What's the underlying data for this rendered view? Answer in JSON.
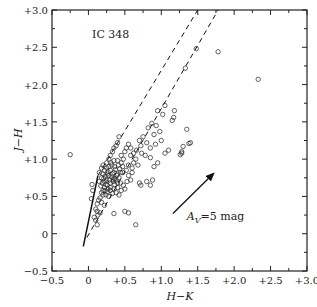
{
  "chart_data": {
    "type": "scatter",
    "title": "IC 348",
    "xlabel": "H−K",
    "ylabel": "J−H",
    "xlim": [
      -0.5,
      3.0
    ],
    "ylim": [
      -0.5,
      3.0
    ],
    "grid": false,
    "legend": null,
    "x_ticks": [
      "-0.5",
      "0",
      "+0.5",
      "+1.0",
      "+1.5",
      "+2.0",
      "+2.5",
      "+3.0"
    ],
    "y_ticks": [
      "-0.5",
      "0",
      "+0.5",
      "+1.0",
      "+1.5",
      "+2.0",
      "+2.5",
      "+3.0"
    ],
    "annotations": [
      {
        "text": "IC 348",
        "x": 0.05,
        "y": 2.62
      },
      {
        "text": "A_V=5 mag",
        "x": 1.35,
        "y": 0.18,
        "arrow_from": [
          1.16,
          0.27
        ],
        "arrow_to": [
          1.72,
          0.81
        ]
      }
    ],
    "lines": [
      {
        "name": "main-sequence-solid",
        "style": "solid",
        "points": [
          [
            -0.07,
            -0.17
          ],
          [
            0.13,
            0.78
          ]
        ]
      },
      {
        "name": "reddening-band-upper",
        "style": "dashed",
        "points": [
          [
            0.13,
            0.78
          ],
          [
            1.5,
            3.0
          ]
        ]
      },
      {
        "name": "reddening-band-lower",
        "style": "dashed",
        "points": [
          [
            -0.02,
            -0.05
          ],
          [
            1.78,
            3.0
          ]
        ]
      }
    ],
    "series": [
      {
        "name": "IC 348 stars",
        "marker": "open-circle",
        "points": [
          [
            -0.25,
            1.06
          ],
          [
            1.78,
            2.44
          ],
          [
            2.33,
            2.07
          ],
          [
            1.48,
            2.48
          ],
          [
            1.33,
            2.22
          ],
          [
            1.18,
            1.65
          ],
          [
            1.05,
            1.72
          ],
          [
            1.02,
            1.6
          ],
          [
            1.17,
            1.56
          ],
          [
            1.15,
            1.52
          ],
          [
            1.35,
            1.4
          ],
          [
            1.4,
            1.22
          ],
          [
            1.38,
            1.21
          ],
          [
            1.28,
            1.08
          ],
          [
            1.3,
            1.17
          ],
          [
            1.28,
            1.1
          ],
          [
            1.26,
            1.06
          ],
          [
            0.95,
            1.65
          ],
          [
            0.93,
            1.45
          ],
          [
            0.87,
            1.48
          ],
          [
            0.82,
            1.42
          ],
          [
            0.98,
            1.37
          ],
          [
            0.9,
            1.33
          ],
          [
            0.85,
            1.15
          ],
          [
            1.05,
            1.08
          ],
          [
            1.1,
            1.12
          ],
          [
            0.75,
            1.3
          ],
          [
            0.7,
            1.25
          ],
          [
            0.72,
            1.18
          ],
          [
            0.8,
            1.22
          ],
          [
            0.95,
            0.95
          ],
          [
            0.9,
            0.9
          ],
          [
            0.88,
            0.72
          ],
          [
            0.8,
            0.7
          ],
          [
            0.85,
            0.65
          ],
          [
            0.6,
            0.88
          ],
          [
            0.55,
            1.2
          ],
          [
            0.52,
            1.15
          ],
          [
            0.5,
            1.1
          ],
          [
            0.58,
            1.05
          ],
          [
            0.65,
            1.0
          ],
          [
            0.62,
            0.95
          ],
          [
            0.68,
            0.92
          ],
          [
            0.45,
            0.95
          ],
          [
            0.47,
            0.9
          ],
          [
            0.42,
            1.3
          ],
          [
            0.4,
            1.22
          ],
          [
            0.38,
            1.18
          ],
          [
            0.35,
            1.15
          ],
          [
            0.33,
            1.1
          ],
          [
            0.3,
            1.05
          ],
          [
            0.45,
            1.05
          ],
          [
            0.48,
            1.0
          ],
          [
            0.35,
            0.98
          ],
          [
            0.32,
            0.92
          ],
          [
            0.28,
            0.9
          ],
          [
            0.25,
            0.88
          ],
          [
            0.22,
            0.85
          ],
          [
            0.2,
            0.8
          ],
          [
            0.18,
            0.75
          ],
          [
            0.15,
            0.7
          ],
          [
            0.3,
            0.85
          ],
          [
            0.35,
            0.82
          ],
          [
            0.4,
            0.8
          ],
          [
            0.42,
            0.75
          ],
          [
            0.38,
            0.72
          ],
          [
            0.34,
            0.7
          ],
          [
            0.3,
            0.68
          ],
          [
            0.26,
            0.65
          ],
          [
            0.22,
            0.62
          ],
          [
            0.2,
            0.58
          ],
          [
            0.18,
            0.55
          ],
          [
            0.28,
            0.78
          ],
          [
            0.32,
            0.76
          ],
          [
            0.36,
            0.74
          ],
          [
            0.25,
            0.72
          ],
          [
            0.22,
            0.7
          ],
          [
            0.44,
            0.68
          ],
          [
            0.48,
            0.65
          ],
          [
            0.5,
            0.6
          ],
          [
            0.45,
            0.58
          ],
          [
            0.4,
            0.62
          ],
          [
            0.35,
            0.6
          ],
          [
            0.3,
            0.58
          ],
          [
            0.26,
            0.56
          ],
          [
            0.24,
            0.52
          ],
          [
            0.28,
            0.5
          ],
          [
            0.33,
            0.54
          ],
          [
            0.38,
            0.55
          ],
          [
            0.42,
            0.52
          ],
          [
            0.16,
            0.48
          ],
          [
            0.14,
            0.45
          ],
          [
            0.12,
            0.4
          ],
          [
            0.18,
            0.42
          ],
          [
            0.22,
            0.38
          ],
          [
            0.05,
            0.66
          ],
          [
            0.06,
            0.58
          ],
          [
            0.04,
            0.47
          ],
          [
            0.1,
            0.33
          ],
          [
            0.12,
            0.3
          ],
          [
            0.08,
            0.22
          ],
          [
            0.1,
            0.18
          ],
          [
            0.13,
            0.25
          ],
          [
            0.16,
            0.28
          ],
          [
            0.12,
            0.12
          ],
          [
            0.35,
            0.27
          ],
          [
            0.5,
            0.3
          ],
          [
            0.55,
            0.28
          ],
          [
            0.65,
            0.12
          ],
          [
            0.7,
            0.68
          ],
          [
            0.72,
            0.65
          ],
          [
            0.55,
            0.78
          ],
          [
            0.58,
            0.72
          ],
          [
            0.6,
            0.82
          ],
          [
            0.25,
            0.95
          ],
          [
            0.28,
            1.0
          ],
          [
            0.2,
            0.92
          ],
          [
            0.18,
            0.88
          ],
          [
            0.15,
            0.82
          ],
          [
            0.4,
            0.98
          ],
          [
            0.43,
            0.87
          ],
          [
            0.47,
            0.82
          ],
          [
            0.52,
            0.85
          ],
          [
            0.55,
            0.92
          ],
          [
            0.3,
            0.62
          ],
          [
            0.27,
            0.6
          ],
          [
            0.24,
            0.66
          ],
          [
            0.36,
            0.66
          ],
          [
            0.4,
            0.68
          ],
          [
            0.33,
            0.8
          ],
          [
            0.37,
            0.86
          ],
          [
            0.27,
            0.83
          ],
          [
            0.23,
            0.77
          ],
          [
            0.19,
            0.68
          ],
          [
            0.21,
            0.74
          ],
          [
            0.17,
            0.64
          ],
          [
            0.29,
            0.72
          ],
          [
            0.31,
            0.95
          ],
          [
            0.36,
            0.9
          ],
          [
            0.41,
            0.92
          ],
          [
            0.44,
            0.82
          ],
          [
            0.39,
            0.78
          ],
          [
            0.26,
            0.8
          ],
          [
            0.34,
            0.73
          ],
          [
            0.23,
            0.58
          ],
          [
            0.2,
            0.52
          ],
          [
            0.62,
            1.08
          ],
          [
            0.66,
            1.12
          ],
          [
            0.58,
            1.15
          ],
          [
            0.73,
            1.08
          ],
          [
            0.78,
            1.05
          ],
          [
            0.85,
            1.02
          ],
          [
            0.92,
            1.2
          ],
          [
            1.0,
            1.25
          ],
          [
            0.53,
            0.7
          ]
        ]
      }
    ]
  }
}
